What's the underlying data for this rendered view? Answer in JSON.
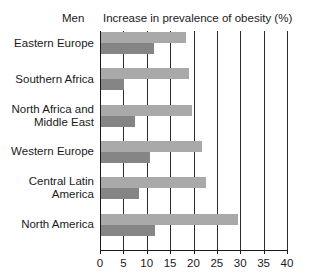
{
  "header": {
    "series_title": "Men",
    "chart_title": "Increase in prevalence of obesity (%)"
  },
  "chart_data": {
    "type": "bar",
    "orientation": "horizontal",
    "title": "Increase in prevalence of obesity (%)",
    "subtitle": "Men",
    "xlabel": "",
    "ylabel": "",
    "xlim": [
      0,
      40
    ],
    "xticks": [
      0,
      5,
      10,
      15,
      20,
      25,
      30,
      35,
      40
    ],
    "xticklabels": [
      "0",
      "5",
      "10",
      "15",
      "20",
      "25",
      "30",
      "35",
      "40"
    ],
    "grid": "vertical",
    "legend": "none",
    "categories": [
      "Eastern Europe",
      "Southern Africa",
      "North Africa and Middle East",
      "Western Europe",
      "Central Latin America",
      "North America"
    ],
    "category_lines": [
      [
        "Eastern Europe"
      ],
      [
        "Southern Africa"
      ],
      [
        "North Africa and",
        "Middle East"
      ],
      [
        "Western Europe"
      ],
      [
        "Central Latin",
        "America"
      ],
      [
        "North America"
      ]
    ],
    "series": [
      {
        "name": "series-light",
        "color": "#a9a9a9",
        "values": [
          18.2,
          18.8,
          19.5,
          21.6,
          22.5,
          29.3
        ]
      },
      {
        "name": "series-dark",
        "color": "#858585",
        "values": [
          11.3,
          4.9,
          7.3,
          10.5,
          8.1,
          11.6
        ]
      }
    ]
  }
}
